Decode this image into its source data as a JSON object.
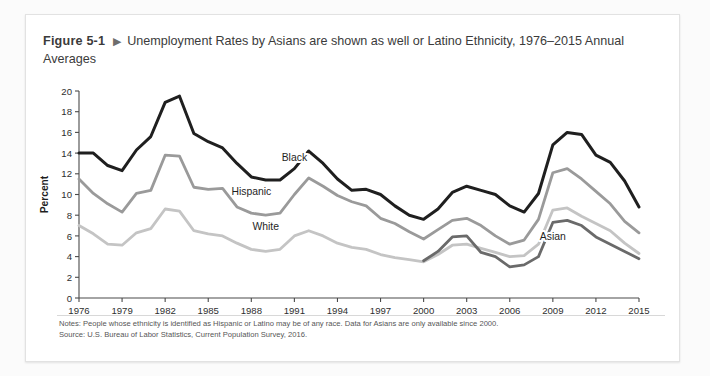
{
  "figure": {
    "number": "Figure 5-1",
    "arrow_icon": "triangle-right-icon",
    "title": "Unemployment Rates by Asians are shown as well or Latino Ethnicity, 1976–2015 Annual Averages"
  },
  "notes": {
    "note_line": "Notes: People whose ethnicity is identified as Hispanic or Latino may be of any race. Data for Asians are only available since 2000.",
    "source_line": "Source: U.S. Bureau of Labor Statistics, Current Population Survey, 2016."
  },
  "colors": {
    "black_series": "#1f1f1f",
    "hispanic_series": "#9a9a9a",
    "white_series": "#c4c4c4",
    "asian_series": "#6a6a6a",
    "axis": "#4a4a4a",
    "card_border": "#e2e2e2"
  },
  "chart_data": {
    "type": "line",
    "title": "Unemployment Rates by Asians are shown as well or Latino Ethnicity, 1976–2015 Annual Averages",
    "xlabel": "",
    "ylabel": "Percent",
    "xlim": [
      1976,
      2015
    ],
    "ylim": [
      0,
      20
    ],
    "ytick_step": 2,
    "yticks": [
      0,
      2,
      4,
      6,
      8,
      10,
      12,
      14,
      16,
      18,
      20
    ],
    "xticks": [
      1976,
      1979,
      1982,
      1985,
      1988,
      1991,
      1994,
      1997,
      2000,
      2003,
      2006,
      2009,
      2012,
      2015
    ],
    "x": [
      1976,
      1977,
      1978,
      1979,
      1980,
      1981,
      1982,
      1983,
      1984,
      1985,
      1986,
      1987,
      1988,
      1989,
      1990,
      1991,
      1992,
      1993,
      1994,
      1995,
      1996,
      1997,
      1998,
      1999,
      2000,
      2001,
      2002,
      2003,
      2004,
      2005,
      2006,
      2007,
      2008,
      2009,
      2010,
      2011,
      2012,
      2013,
      2014,
      2015
    ],
    "grid": false,
    "legend_position": "inline-labels",
    "series": [
      {
        "name": "Black",
        "color": "#1f1f1f",
        "label_x": 1991,
        "label_y": 13.2,
        "values": [
          14.0,
          14.0,
          12.8,
          12.3,
          14.3,
          15.6,
          18.9,
          19.5,
          15.9,
          15.1,
          14.5,
          13.0,
          11.7,
          11.4,
          11.4,
          12.5,
          14.2,
          13.0,
          11.5,
          10.4,
          10.5,
          10.0,
          8.9,
          8.0,
          7.6,
          8.6,
          10.2,
          10.8,
          10.4,
          10.0,
          8.9,
          8.3,
          10.1,
          14.8,
          16.0,
          15.8,
          13.8,
          13.1,
          11.3,
          8.8
        ]
      },
      {
        "name": "Hispanic",
        "color": "#9a9a9a",
        "label_x": 1988,
        "label_y": 10.0,
        "values": [
          11.5,
          10.1,
          9.1,
          8.3,
          10.1,
          10.4,
          13.8,
          13.7,
          10.7,
          10.5,
          10.6,
          8.8,
          8.2,
          8.0,
          8.2,
          10.0,
          11.6,
          10.8,
          9.9,
          9.3,
          8.9,
          7.7,
          7.2,
          6.4,
          5.7,
          6.6,
          7.5,
          7.7,
          7.0,
          6.0,
          5.2,
          5.6,
          7.6,
          12.1,
          12.5,
          11.5,
          10.3,
          9.1,
          7.4,
          6.3
        ]
      },
      {
        "name": "White",
        "color": "#c4c4c4",
        "label_x": 1989,
        "label_y": 6.6,
        "values": [
          7.0,
          6.2,
          5.2,
          5.1,
          6.3,
          6.7,
          8.6,
          8.4,
          6.5,
          6.2,
          6.0,
          5.3,
          4.7,
          4.5,
          4.7,
          6.0,
          6.5,
          6.0,
          5.3,
          4.9,
          4.7,
          4.2,
          3.9,
          3.7,
          3.5,
          4.2,
          5.1,
          5.2,
          4.8,
          4.4,
          4.0,
          4.1,
          5.2,
          8.5,
          8.7,
          7.9,
          7.2,
          6.5,
          5.3,
          4.3
        ]
      },
      {
        "name": "Asian",
        "color": "#6a6a6a",
        "label_x": 2009,
        "label_y": 5.6,
        "start_year": 2000,
        "values": [
          null,
          null,
          null,
          null,
          null,
          null,
          null,
          null,
          null,
          null,
          null,
          null,
          null,
          null,
          null,
          null,
          null,
          null,
          null,
          null,
          null,
          null,
          null,
          null,
          3.6,
          4.5,
          5.9,
          6.0,
          4.4,
          4.0,
          3.0,
          3.2,
          4.0,
          7.3,
          7.5,
          7.0,
          5.9,
          5.2,
          4.5,
          3.8
        ]
      }
    ]
  }
}
